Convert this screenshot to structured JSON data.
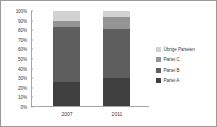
{
  "chart_data": {
    "type": "bar",
    "subtype": "stacked-100-percent",
    "title": "",
    "xlabel": "",
    "ylabel": "",
    "categories": [
      "2007",
      "2011"
    ],
    "ylim": [
      0,
      100
    ],
    "ytick_labels": [
      "0%",
      "10%",
      "20%",
      "30%",
      "40%",
      "50%",
      "60%",
      "70%",
      "80%",
      "90%",
      "100%"
    ],
    "ytick_values": [
      0,
      10,
      20,
      30,
      40,
      50,
      60,
      70,
      80,
      90,
      100
    ],
    "grid": false,
    "legend_position": "right",
    "series": [
      {
        "name": "Partei A",
        "values": [
          25,
          30
        ],
        "color": "#3f3f3f"
      },
      {
        "name": "Partei B",
        "values": [
          58,
          51
        ],
        "color": "#5e5e5e"
      },
      {
        "name": "Partei C",
        "values": [
          7,
          13
        ],
        "color": "#949494"
      },
      {
        "name": "Übrige Parteien",
        "values": [
          10,
          6
        ],
        "color": "#d2d2d2"
      }
    ],
    "legend_entries": [
      {
        "label": "Übrige Parteien",
        "color": "#d2d2d2"
      },
      {
        "label": "Partei C",
        "color": "#949494"
      },
      {
        "label": "Partei B",
        "color": "#5e5e5e"
      },
      {
        "label": "Partei A",
        "color": "#3f3f3f"
      }
    ]
  },
  "colors": {
    "background": "#ffffff",
    "border": "#9a9a9a",
    "axis": "#a6a6a6",
    "text": "#3a3a3a"
  }
}
